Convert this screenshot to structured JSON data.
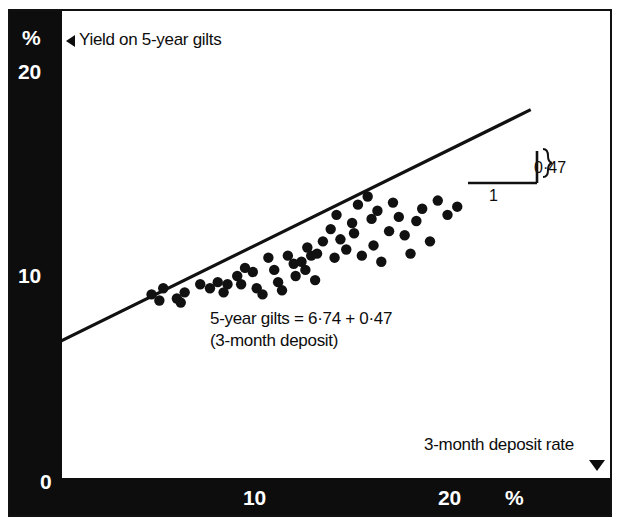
{
  "chart_data": {
    "type": "scatter",
    "title": "",
    "xlabel": "3-month deposit rate",
    "ylabel": "Yield on 5-year gilts",
    "x_unit": "%",
    "y_unit": "%",
    "xlim": [
      0,
      25.1
    ],
    "ylim": [
      0,
      23
    ],
    "xticks": [
      0,
      10,
      20
    ],
    "xtick_labels": [
      "0",
      "10",
      "20"
    ],
    "yticks": [
      10,
      20
    ],
    "ytick_labels": [
      "10",
      "20"
    ],
    "grid": false,
    "legend": "none",
    "annotations": {
      "equation_line1": "5-year gilts = 6·74 + 0·47",
      "equation_line2": "(3-month deposit)",
      "intercept_label": "6·74",
      "slope_run_label": "1",
      "slope_rise_label": "0·47",
      "y_axis_caption": "Yield on 5-year gilts",
      "x_axis_caption": "3-month deposit rate",
      "y_axis_marker": "left-triangle",
      "x_axis_marker": "down-triangle"
    },
    "fit": {
      "intercept": 6.74,
      "slope": 0.47,
      "x_start": 0.0,
      "y_start": 6.74,
      "x_end": 24.0,
      "y_end": 18.02
    },
    "series": [
      {
        "name": "observations",
        "marker": "filled-circle",
        "color": "#111111",
        "points": [
          [
            4.6,
            9.0
          ],
          [
            5.2,
            9.3
          ],
          [
            5.0,
            8.7
          ],
          [
            5.9,
            8.8
          ],
          [
            6.3,
            9.1
          ],
          [
            6.1,
            8.6
          ],
          [
            7.1,
            9.5
          ],
          [
            7.6,
            9.3
          ],
          [
            8.0,
            9.6
          ],
          [
            8.5,
            9.5
          ],
          [
            8.3,
            9.1
          ],
          [
            9.0,
            9.9
          ],
          [
            9.4,
            10.3
          ],
          [
            9.2,
            9.5
          ],
          [
            9.8,
            10.1
          ],
          [
            10.0,
            9.3
          ],
          [
            10.3,
            9.0
          ],
          [
            10.6,
            10.8
          ],
          [
            10.9,
            10.2
          ],
          [
            11.1,
            9.6
          ],
          [
            11.3,
            9.2
          ],
          [
            11.6,
            10.9
          ],
          [
            11.9,
            10.5
          ],
          [
            12.0,
            9.9
          ],
          [
            12.3,
            10.6
          ],
          [
            12.6,
            11.3
          ],
          [
            12.8,
            10.9
          ],
          [
            12.5,
            10.2
          ],
          [
            13.1,
            11.0
          ],
          [
            13.4,
            11.6
          ],
          [
            13.0,
            9.7
          ],
          [
            13.8,
            12.2
          ],
          [
            14.1,
            12.9
          ],
          [
            14.3,
            11.7
          ],
          [
            14.0,
            10.8
          ],
          [
            14.6,
            11.2
          ],
          [
            14.9,
            12.5
          ],
          [
            15.2,
            13.4
          ],
          [
            15.0,
            12.0
          ],
          [
            15.4,
            10.9
          ],
          [
            15.7,
            13.8
          ],
          [
            15.9,
            12.7
          ],
          [
            16.2,
            13.1
          ],
          [
            16.0,
            11.4
          ],
          [
            16.4,
            10.6
          ],
          [
            16.8,
            12.1
          ],
          [
            17.0,
            13.5
          ],
          [
            17.3,
            12.8
          ],
          [
            17.6,
            11.9
          ],
          [
            17.9,
            11.0
          ],
          [
            18.2,
            12.6
          ],
          [
            18.5,
            13.2
          ],
          [
            18.9,
            11.6
          ],
          [
            19.3,
            13.6
          ],
          [
            19.8,
            12.9
          ],
          [
            20.3,
            13.3
          ]
        ]
      }
    ]
  }
}
